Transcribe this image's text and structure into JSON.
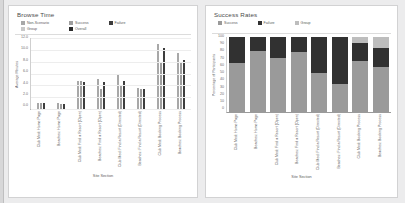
{
  "theme": {
    "page_background": "#ececed",
    "panel_background": "#ffffff",
    "color_non_scenario": "#a8a8a8",
    "color_group": "#c9c9c9",
    "color_success": "#9e9e9e",
    "color_overall": "#2b2b2b",
    "color_failure": "#3d3d3d",
    "color_success_stack": "#9a9a9a",
    "color_failure_stack": "#313131",
    "color_group_stack": "#bdbdbd"
  },
  "categories": [
    "Club Med: Home Page",
    "Beaches: Home Page",
    "Club Med: Find a Resort (Open)",
    "Beaches: Find a Resort (Open)",
    "Club Med: Find a Resort (Directed)",
    "Beaches: Find a Resort (Directed)",
    "Club Med: Booking Process",
    "Beaches: Booking Process"
  ],
  "browse_time": {
    "title": "Browse Time",
    "legend": [
      {
        "label": "Non-Scenario",
        "color": "#a8a8a8"
      },
      {
        "label": "Group",
        "color": "#c9c9c9"
      },
      {
        "label": "Success",
        "color": "#9e9e9e"
      },
      {
        "label": "Overall",
        "color": "#2b2b2b"
      },
      {
        "label": "Failure",
        "color": "#3d3d3d"
      }
    ],
    "chart_data": {
      "type": "bar",
      "title": "Browse Time",
      "xlabel": "Site Section",
      "ylabel": "Average Minutes",
      "ylim": [
        0,
        12
      ],
      "yticks": [
        "0.0",
        "2.0",
        "4.0",
        "6.0",
        "8.0",
        "10.0",
        "12.0"
      ],
      "grid": true,
      "legend_position": "top",
      "categories": [
        "Club Med: Home Page",
        "Beaches: Home Page",
        "Club Med: Find a Resort (Open)",
        "Beaches: Find a Resort (Open)",
        "Club Med: Find a Resort (Directed)",
        "Beaches: Find a Resort (Directed)",
        "Club Med: Booking Process",
        "Beaches: Booking Process"
      ],
      "series": [
        {
          "name": "Non-Scenario",
          "color": "#a8a8a8",
          "values": [
            1.1,
            1.0,
            4.7,
            5.0,
            5.8,
            3.5,
            11.0,
            9.5
          ]
        },
        {
          "name": "Success",
          "color": "#9e9e9e",
          "values": [
            1.0,
            0.9,
            4.7,
            3.4,
            3.9,
            3.3,
            8.0,
            7.9
          ]
        },
        {
          "name": "Failure",
          "color": "#3d3d3d",
          "values": [
            1.0,
            0.8,
            4.6,
            4.6,
            4.8,
            3.4,
            10.3,
            8.3
          ]
        }
      ]
    }
  },
  "success_rates": {
    "title": "Success Rates",
    "legend": [
      {
        "label": "Success",
        "color": "#9a9a9a"
      },
      {
        "label": "Failure",
        "color": "#313131"
      },
      {
        "label": "Group",
        "color": "#bdbdbd"
      }
    ],
    "chart_data": {
      "type": "bar",
      "stacked": true,
      "title": "Success Rates",
      "xlabel": "Site Section",
      "ylabel": "Percentage of Participants",
      "ylim": [
        0,
        100
      ],
      "yticks": [
        "0",
        "10",
        "20",
        "30",
        "40",
        "50",
        "60",
        "70",
        "80",
        "90",
        "100"
      ],
      "grid": false,
      "legend_position": "top",
      "categories": [
        "Club Med: Home Page",
        "Beaches: Home Page",
        "Club Med: Find a Resort (Open)",
        "Beaches: Find a Resort (Open)",
        "Club Med: Find a Resort (Directed)",
        "Beaches: Find a Resort (Directed)",
        "Club Med: Booking Process",
        "Beaches: Booking Process"
      ],
      "series": [
        {
          "name": "Success",
          "color": "#9a9a9a",
          "values": [
            65,
            82,
            72,
            80,
            52,
            38,
            68,
            60
          ]
        },
        {
          "name": "Failure",
          "color": "#313131",
          "values": [
            35,
            18,
            28,
            20,
            48,
            62,
            24,
            26
          ]
        },
        {
          "name": "Group",
          "color": "#bdbdbd",
          "values": [
            0,
            0,
            0,
            0,
            0,
            0,
            8,
            14
          ]
        }
      ]
    }
  }
}
